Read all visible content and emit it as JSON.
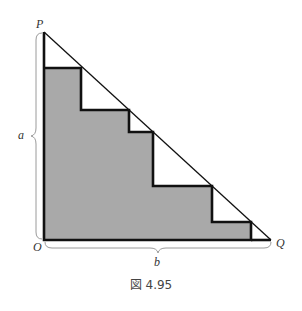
{
  "figure": {
    "caption": "図 4.95",
    "labels": {
      "P": "P",
      "O": "O",
      "Q": "Q",
      "a": "a",
      "b": "b"
    },
    "colors": {
      "fill": "#a9a9a9",
      "stroke": "#111111",
      "brace": "#9a9a9a",
      "background": "#ffffff"
    },
    "geometry": {
      "P": [
        44,
        32
      ],
      "O": [
        44,
        240
      ],
      "Q": [
        271,
        240
      ],
      "staircase_corners": [
        [
          44,
          68
        ],
        [
          81,
          68
        ],
        [
          81,
          110
        ],
        [
          129,
          110
        ],
        [
          129,
          132
        ],
        [
          153,
          132
        ],
        [
          153,
          186
        ],
        [
          212,
          186
        ],
        [
          212,
          222
        ],
        [
          251,
          222
        ],
        [
          251,
          240
        ]
      ]
    }
  }
}
